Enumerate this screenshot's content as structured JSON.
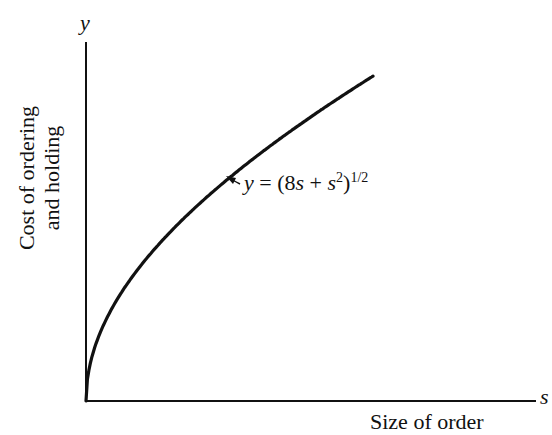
{
  "chart_data": {
    "type": "line",
    "title": "",
    "xlabel": "Size of order",
    "ylabel": "Cost of ordering and holding",
    "x_axis_symbol": "s",
    "y_axis_symbol": "y",
    "annotation": "y = (8s + s²)^(1/2)",
    "series": [
      {
        "name": "y = (8s + s^2)^(1/2)",
        "x": [
          0,
          0.05,
          0.1,
          0.2,
          0.3,
          0.4,
          0.5,
          0.6,
          0.7,
          0.8,
          0.9,
          1.0
        ],
        "values": [
          0,
          0.64,
          0.9,
          1.28,
          1.58,
          1.84,
          2.06,
          2.27,
          2.47,
          2.65,
          2.83,
          3.0
        ]
      }
    ],
    "ticks": "none",
    "grid": false,
    "legend": "none"
  },
  "labels": {
    "y_symbol": "y",
    "s_symbol": "s",
    "ylabel_line1": "Cost of ordering",
    "ylabel_line2": "and holding",
    "xlabel": "Size of order",
    "eq_y": "y",
    "eq_rest": " = (8",
    "eq_s1": "s",
    "eq_plus": " + ",
    "eq_s2": "s",
    "eq_sq": "2",
    "eq_close": ")",
    "eq_exp": "1/2"
  }
}
